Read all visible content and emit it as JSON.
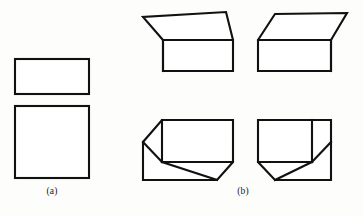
{
  "figure": {
    "background_color": "#fdfdfc",
    "stroke_color": "#111111",
    "fill_color": "#ffffff",
    "stroke_width": 2.1,
    "width": 363,
    "height": 216
  },
  "panels": [
    {
      "id": "a",
      "label": "(a)",
      "label_x": 52,
      "label_y": 192,
      "description": "two flat rectangles stacked vertically, orthographic views",
      "shapes": [
        {
          "name": "rectangle-top",
          "kind": "rect",
          "x": 15,
          "y": 59,
          "width": 74,
          "height": 35
        },
        {
          "name": "square-bottom",
          "kind": "rect",
          "x": 15,
          "y": 106,
          "width": 74,
          "height": 72
        }
      ]
    },
    {
      "id": "b",
      "label": "(b)",
      "label_x": 243,
      "label_y": 192,
      "description": "four shaded-free line drawings of a rectangular box seen from four viewpoints",
      "shapes": [
        {
          "name": "box-top-left",
          "kind": "box",
          "view": "above-left",
          "outline": "163,40 143,17 226,12 233,40 233,71 163,71",
          "edges": [
            "163,40 233,40",
            "163,40 163,71"
          ]
        },
        {
          "name": "box-top-right",
          "kind": "box",
          "view": "above-right",
          "outline": "258,40 275,14 347,13 331,40 331,71 258,71",
          "edges": [
            "258,40 331,40",
            "331,40 331,71"
          ]
        },
        {
          "name": "box-bottom-left",
          "kind": "box",
          "view": "below-left",
          "outline": "162,120 233,120 233,162 217,180 143,180 143,142",
          "edges": [
            "162,120 162,162",
            "162,162 233,162",
            "143,142 162,162",
            "162,162 217,180"
          ]
        },
        {
          "name": "box-bottom-right",
          "kind": "box",
          "view": "below-right",
          "outline": "258,120 331,120 331,142 331,180 275,180 258,162",
          "edges": [
            "312,120 312,162",
            "258,162 312,162",
            "312,162 331,142",
            "275,180 312,162"
          ]
        }
      ]
    }
  ]
}
